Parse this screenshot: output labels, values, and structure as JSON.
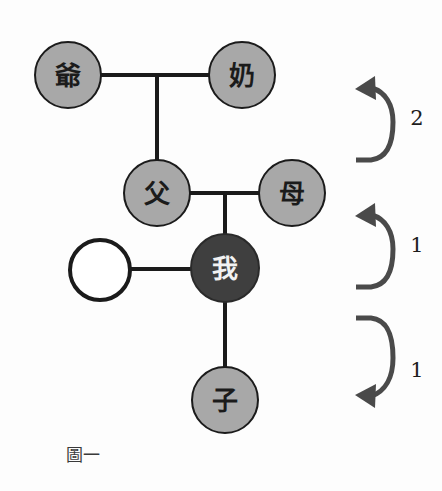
{
  "figure": {
    "caption": "圖一",
    "background_color": "#fdfdfd"
  },
  "colors": {
    "node_fill_gray": "#a8a8a8",
    "node_fill_dark": "#3f3f3f",
    "node_fill_empty": "#ffffff",
    "node_stroke": "#1b1b1b",
    "link_stroke": "#1b1b1b",
    "arrow_stroke": "#4a4a4a",
    "label_dark": "#1b1b1b",
    "label_light": "#f2f2f2"
  },
  "nodes": [
    {
      "id": "grandfather",
      "label": "爺",
      "role": "paternal-grandfather",
      "cx": 68,
      "cy": 75,
      "r": 33,
      "fill": "#a8a8a8",
      "text_color": "#1b1b1b"
    },
    {
      "id": "grandmother",
      "label": "奶",
      "role": "paternal-grandmother",
      "cx": 242,
      "cy": 75,
      "r": 33,
      "fill": "#a8a8a8",
      "text_color": "#1b1b1b"
    },
    {
      "id": "father",
      "label": "父",
      "role": "father",
      "cx": 157,
      "cy": 193,
      "r": 33,
      "fill": "#a8a8a8",
      "text_color": "#1b1b1b"
    },
    {
      "id": "mother",
      "label": "母",
      "role": "mother",
      "cx": 292,
      "cy": 193,
      "r": 33,
      "fill": "#a8a8a8",
      "text_color": "#1b1b1b"
    },
    {
      "id": "self",
      "label": "我",
      "role": "ego-self",
      "cx": 225,
      "cy": 268,
      "r": 34,
      "fill": "#3f3f3f",
      "text_color": "#f2f2f2"
    },
    {
      "id": "spouse",
      "label": "",
      "role": "spouse-unlabeled",
      "cx": 100,
      "cy": 270,
      "r": 30,
      "fill": "#ffffff",
      "text_color": "#1b1b1b"
    },
    {
      "id": "child",
      "label": "子",
      "role": "child-son",
      "cx": 225,
      "cy": 400,
      "r": 33,
      "fill": "#a8a8a8",
      "text_color": "#1b1b1b"
    }
  ],
  "links": [
    {
      "id": "grandparents-union",
      "from": "grandfather",
      "to": "grandmother",
      "kind": "marriage-horizontal"
    },
    {
      "id": "grandparents-to-father",
      "from": "grandparents-union",
      "to": "father",
      "kind": "descent-vertical"
    },
    {
      "id": "parents-union",
      "from": "father",
      "to": "mother",
      "kind": "marriage-horizontal"
    },
    {
      "id": "parents-to-self",
      "from": "parents-union",
      "to": "self",
      "kind": "descent-vertical"
    },
    {
      "id": "self-spouse-union",
      "from": "spouse",
      "to": "self",
      "kind": "marriage-horizontal"
    },
    {
      "id": "self-to-child",
      "from": "self",
      "to": "child",
      "kind": "descent-vertical"
    }
  ],
  "generation_arrows": [
    {
      "id": "arrow-up-two",
      "number": "2",
      "direction": "up",
      "meaning": "two generations up",
      "number_x": 417,
      "number_y": 118
    },
    {
      "id": "arrow-up-one",
      "number": "1",
      "direction": "up",
      "meaning": "one generation up",
      "number_x": 417,
      "number_y": 245
    },
    {
      "id": "arrow-down-one",
      "number": "1",
      "direction": "down",
      "meaning": "one generation down",
      "number_x": 417,
      "number_y": 370
    }
  ]
}
